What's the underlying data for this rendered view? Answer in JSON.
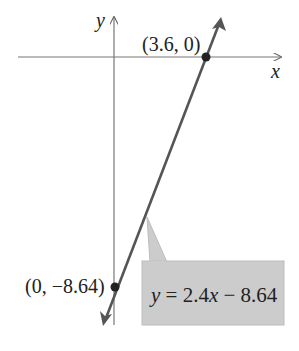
{
  "diagram": {
    "axes": {
      "x_label": "x",
      "y_label": "y"
    },
    "line": {
      "equation": "y = 2.4x − 8.64",
      "equation_parts": [
        "y",
        " = 2.4",
        "x",
        " − 8.64"
      ],
      "slope": 2.4,
      "intercept": -8.64,
      "color": "#555555"
    },
    "points": [
      {
        "label": "(3.6, 0)",
        "x": 3.6,
        "y": 0
      },
      {
        "label": "(0, −8.64)",
        "x": 0,
        "y": -8.64
      }
    ],
    "callout": {
      "fill": "#cccccc"
    }
  }
}
